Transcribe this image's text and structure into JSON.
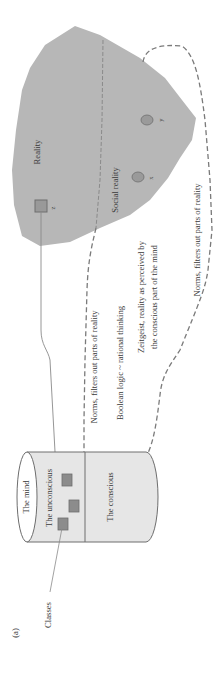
{
  "figure": {
    "panel_label": "(a)",
    "mind": {
      "title": "The mind",
      "unconscious_label": "The unconscious",
      "conscious_label": "The conscious"
    },
    "classes_label": "Classes",
    "reality": {
      "label": "Reality",
      "social_label": "Social reality",
      "points": [
        {
          "id": "z",
          "shape": "square"
        },
        {
          "id": "x",
          "shape": "circle"
        },
        {
          "id": "y",
          "shape": "circle"
        }
      ]
    },
    "annotations": {
      "norms_inner": "Norms, filters out parts of reality",
      "boolean": "Boolean logic ~ rational thinking",
      "zeitgeist_line1": "Zeitgeist, reality as perceived by",
      "zeitgeist_line2": "the conscious part of the mind",
      "norms_outer": "Norms, filters out parts of reality"
    },
    "colors": {
      "reality_fill": "#b7b7b7",
      "cylinder_fill": "#e6e6e6",
      "box_fill": "#8c8c8c",
      "stroke": "#6e6e6e",
      "dashed": "#7a7a7a"
    }
  }
}
